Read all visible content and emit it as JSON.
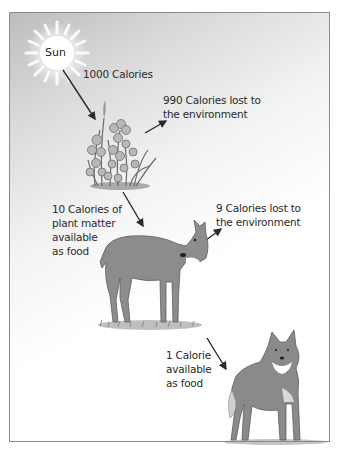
{
  "diagram": {
    "type": "energy-flow food chain",
    "nodes": [
      {
        "id": "sun",
        "label": "Sun"
      },
      {
        "id": "plants",
        "label": "Plants"
      },
      {
        "id": "deer",
        "label": "Deer"
      },
      {
        "id": "wolf",
        "label": "Wolf"
      }
    ],
    "labels": {
      "sun": "Sun",
      "sun_to_plants": "1000 Calories",
      "plants_lost": "990 Calories lost to\nthe environment",
      "plants_to_deer": "10 Calories of\nplant matter\navailable\nas food",
      "deer_lost": "9 Calories lost to\nthe environment",
      "deer_to_wolf": "1 Calorie\navailable\nas food"
    },
    "edges": [
      {
        "from": "sun",
        "to": "plants",
        "label": "1000 Calories"
      },
      {
        "from": "plants",
        "to": "environment",
        "label": "990 Calories lost to the environment"
      },
      {
        "from": "plants",
        "to": "deer",
        "label": "10 Calories of plant matter available as food"
      },
      {
        "from": "deer",
        "to": "environment",
        "label": "9 Calories lost to the environment"
      },
      {
        "from": "deer",
        "to": "wolf",
        "label": "1 Calorie available as food"
      }
    ],
    "colors": {
      "arrow": "#2b2b2b",
      "animal_fill": "#8c8c8c",
      "border": "#8a8a8a",
      "text": "#2a2a2a"
    }
  }
}
